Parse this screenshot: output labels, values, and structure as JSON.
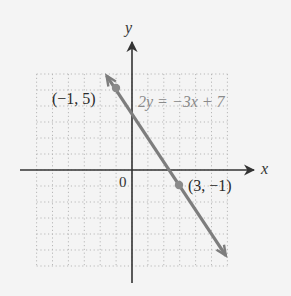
{
  "chart_data": {
    "type": "line",
    "title": "",
    "xlabel": "x",
    "ylabel": "y",
    "origin_label": "0",
    "xlim": [
      -6,
      6
    ],
    "ylim": [
      -6,
      6
    ],
    "grid": true,
    "series": [
      {
        "name": "2y = −3x + 7",
        "equation": "2y = −3x + 7",
        "slope": -1.5,
        "intercept": 3.5,
        "x": [
          -1.6,
          5.9
        ],
        "y": [
          5.9,
          -5.35
        ],
        "color": "#7d7d7d"
      }
    ],
    "points": [
      {
        "x": -1,
        "y": 5,
        "label": "(−1, 5)"
      },
      {
        "x": 3,
        "y": -1,
        "label": "(3, −1)"
      }
    ],
    "annotations": [
      {
        "text": "2y = −3x + 7",
        "near": [
          0.2,
          4.1
        ]
      }
    ]
  },
  "colors": {
    "background": "#f4f4f4",
    "axis": "#333333",
    "grid": "#b8b8b8",
    "line": "#7d7d7d",
    "equation_text": "#8a8a8a",
    "label_text": "#2a2a2a"
  }
}
